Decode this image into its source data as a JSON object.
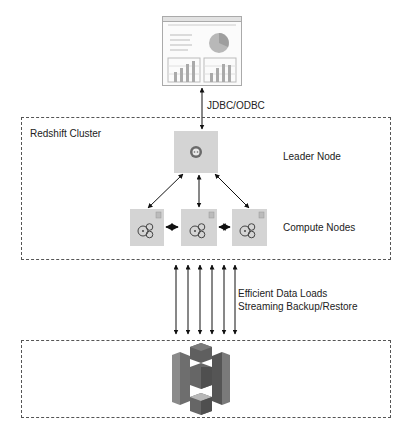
{
  "client": {
    "icon": "dashboard-report-icon",
    "connection_label": "JDBC/ODBC"
  },
  "cluster": {
    "title": "Redshift Cluster",
    "leader": {
      "label": "Leader Node",
      "icon": "leader-node-icon"
    },
    "compute": {
      "label": "Compute Nodes",
      "nodes": [
        {
          "icon": "compute-node-icon"
        },
        {
          "icon": "compute-node-icon"
        },
        {
          "icon": "compute-node-icon"
        }
      ]
    }
  },
  "data_transfer": {
    "arrow_count": 6,
    "lines": [
      "Efficient Data Loads",
      "Streaming Backup/Restore"
    ]
  },
  "storage": {
    "icon": "amazon-s3-icon"
  },
  "colors": {
    "node_fill": "#d4d4d4",
    "s3_dark": "#555555",
    "s3_mid": "#7a7a7a",
    "s3_light": "#9a9a9a",
    "border": "#555555"
  }
}
